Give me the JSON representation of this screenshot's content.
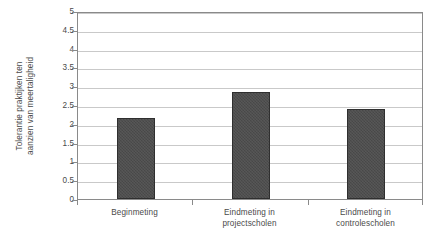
{
  "chart_data": {
    "type": "bar",
    "title": "",
    "subtitle": "",
    "xlabel": "",
    "ylabel": "Tolerantie praktijken ten aanzien van meertaligheid",
    "ylabel_lines": [
      "Tolerantie praktijken ten",
      "aanzien van meertaligheid"
    ],
    "categories": [
      "Beginmeting",
      "Eindmeting in projectscholen",
      "Eindmeting in controlescholen"
    ],
    "category_lines": [
      [
        "Beginmeting"
      ],
      [
        "Eindmeting in",
        "projectscholen"
      ],
      [
        "Eindmeting in",
        "controlescholen"
      ]
    ],
    "values": [
      2.15,
      2.85,
      2.4
    ],
    "ylim": [
      0,
      5
    ],
    "ytick_values": [
      0,
      0.5,
      1,
      1.5,
      2,
      2.5,
      3,
      3.5,
      4,
      4.5,
      5
    ],
    "ytick_labels": [
      "0",
      "0.5",
      "1",
      "1.5",
      "2",
      "2.5",
      "3",
      "3.5",
      "4",
      "4.5",
      "5"
    ],
    "grid": true,
    "legend": false,
    "legend_position": "none",
    "colors": {
      "bar_fill": "#4d4d4d",
      "bar_edge": "#2f2f2f",
      "gridline": "#c9c9c9",
      "axis": "#8a8a8a",
      "text": "#4a4a4a",
      "background": "#ffffff"
    }
  }
}
